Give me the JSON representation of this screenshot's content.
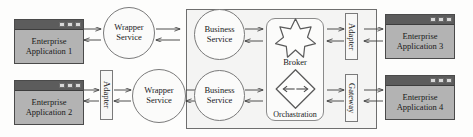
{
  "diagram": {
    "colors": {
      "app_body": "#b3b3b3",
      "app_titlebar": "#5c5c5c",
      "outer_container": "#f4f4f3",
      "stroke": "#6e6e6e",
      "text": "#1a1a1a"
    }
  },
  "apps": [
    {
      "id": "app1",
      "line1": "Enterprise",
      "line2": "Application 1"
    },
    {
      "id": "app2",
      "line1": "Enterprise",
      "line2": "Application 2"
    },
    {
      "id": "app3",
      "line1": "Enterprise",
      "line2": "Application 3"
    },
    {
      "id": "app4",
      "line1": "Enterprise",
      "line2": "Application 4"
    }
  ],
  "wrappers": [
    {
      "id": "wrapper1",
      "line1": "Wrapper",
      "line2": "Service"
    },
    {
      "id": "wrapper2",
      "line1": "Wrapper",
      "line2": "Service"
    }
  ],
  "business_services": [
    {
      "id": "bus1",
      "line1": "Business",
      "line2": "Service"
    },
    {
      "id": "bus2",
      "line1": "Business",
      "line2": "Service"
    }
  ],
  "connectors": {
    "adapter_left": "Adapter",
    "adapter_right": "Adapter",
    "gateway": "Gateway"
  },
  "core_shapes": {
    "broker_label": "Broker",
    "orchestration_label": "Orchastration"
  }
}
